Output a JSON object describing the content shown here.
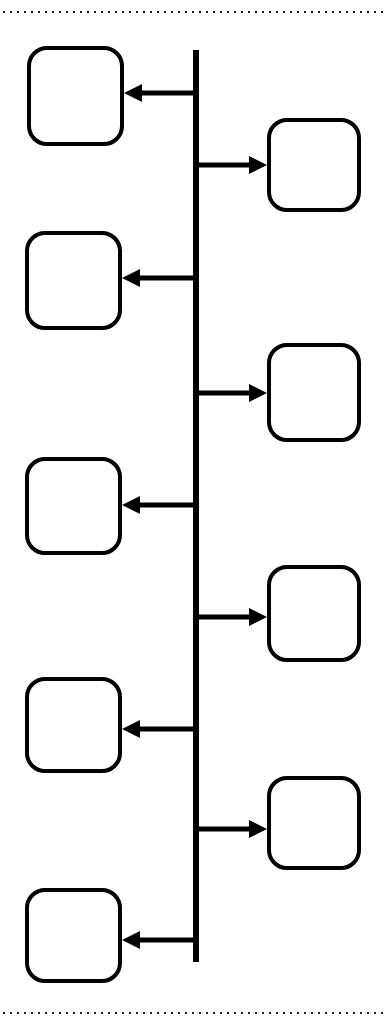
{
  "diagram": {
    "type": "timeline-flow",
    "width": 387,
    "height": 1029,
    "background_color": "#ffffff",
    "stroke_color": "#000000",
    "boundaries": {
      "top_divider": {
        "name": "top-dotted-divider",
        "y": 12,
        "x_start": 3,
        "x_end": 384,
        "style": "dotted",
        "dot_size": 2,
        "dot_gap": 5,
        "color": "#1a1a1a"
      },
      "bottom_divider": {
        "name": "bottom-dotted-divider",
        "y": 1013,
        "x_start": 3,
        "x_end": 384,
        "style": "dotted",
        "dot_size": 2,
        "dot_gap": 5,
        "color": "#1a1a1a"
      }
    },
    "spine": {
      "name": "timeline-spine",
      "x": 196,
      "y_top": 50,
      "y_bottom": 962,
      "width": 6,
      "color": "#000000"
    },
    "node_style": {
      "corner_radius": 18,
      "stroke_width": 4,
      "fill": "#ffffff",
      "stroke": "#000000"
    },
    "arrow_style": {
      "shaft_width": 5,
      "head_length": 18,
      "head_width": 18,
      "color": "#000000"
    },
    "nodes": [
      {
        "id": "node-1",
        "label": "",
        "side": "left",
        "x": 27,
        "y": 46,
        "width": 97,
        "height": 100,
        "arrow": {
          "name": "arrow-to-left-node-1",
          "direction": "left",
          "y": 93,
          "from_x": 196,
          "to_x": 124
        }
      },
      {
        "id": "node-2",
        "label": "",
        "side": "right",
        "x": 267,
        "y": 118,
        "width": 94,
        "height": 94,
        "arrow": {
          "name": "arrow-to-right-node-2",
          "direction": "right",
          "y": 165,
          "from_x": 196,
          "to_x": 267
        }
      },
      {
        "id": "node-3",
        "label": "",
        "side": "left",
        "x": 25,
        "y": 231,
        "width": 97,
        "height": 99,
        "arrow": {
          "name": "arrow-to-left-node-3",
          "direction": "left",
          "y": 278,
          "from_x": 196,
          "to_x": 122
        }
      },
      {
        "id": "node-4",
        "label": "",
        "side": "right",
        "x": 267,
        "y": 343,
        "width": 94,
        "height": 99,
        "arrow": {
          "name": "arrow-to-right-node-4",
          "direction": "right",
          "y": 393,
          "from_x": 196,
          "to_x": 267
        }
      },
      {
        "id": "node-5",
        "label": "",
        "side": "left",
        "x": 25,
        "y": 457,
        "width": 97,
        "height": 98,
        "arrow": {
          "name": "arrow-to-left-node-5",
          "direction": "left",
          "y": 505,
          "from_x": 196,
          "to_x": 122
        }
      },
      {
        "id": "node-6",
        "label": "",
        "side": "right",
        "x": 267,
        "y": 565,
        "width": 94,
        "height": 97,
        "arrow": {
          "name": "arrow-to-right-node-6",
          "direction": "right",
          "y": 617,
          "from_x": 196,
          "to_x": 267
        }
      },
      {
        "id": "node-7",
        "label": "",
        "side": "left",
        "x": 25,
        "y": 677,
        "width": 97,
        "height": 96,
        "arrow": {
          "name": "arrow-to-left-node-7",
          "direction": "left",
          "y": 729,
          "from_x": 196,
          "to_x": 122
        }
      },
      {
        "id": "node-8",
        "label": "",
        "side": "right",
        "x": 267,
        "y": 776,
        "width": 94,
        "height": 94,
        "arrow": {
          "name": "arrow-to-right-node-8",
          "direction": "right",
          "y": 829,
          "from_x": 196,
          "to_x": 267
        }
      },
      {
        "id": "node-9",
        "label": "",
        "side": "left",
        "x": 25,
        "y": 888,
        "width": 97,
        "height": 95,
        "arrow": {
          "name": "arrow-to-left-node-9",
          "direction": "left",
          "y": 940,
          "from_x": 196,
          "to_x": 122
        }
      }
    ]
  }
}
